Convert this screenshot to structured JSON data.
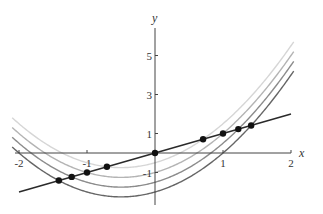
{
  "chart_data": {
    "type": "line",
    "title": "",
    "xlabel": "x",
    "ylabel": "y",
    "xlim": [
      -2,
      2
    ],
    "ylim": [
      -2.3,
      6.2
    ],
    "grid": false,
    "legend": null,
    "x_ticks": [
      -2,
      -1,
      1,
      2
    ],
    "x_tick_labels": [
      "-2",
      "-1",
      "1",
      "2"
    ],
    "y_ticks": [
      -1,
      1,
      3,
      5
    ],
    "y_tick_labels": [
      "-1",
      "1",
      "3",
      "5"
    ],
    "series": [
      {
        "name": "y = x^2 + x - 0.5",
        "formula": "x^2 + x + C",
        "C": -0.5,
        "color": "#d6d6d6"
      },
      {
        "name": "y = x^2 + x - 1",
        "formula": "x^2 + x + C",
        "C": -1,
        "color": "#b4b4b4"
      },
      {
        "name": "y = x^2 + x - 1.5",
        "formula": "x^2 + x + C",
        "C": -1.5,
        "color": "#8c8c8c"
      },
      {
        "name": "y = x^2 + x - 2",
        "formula": "x^2 + x + C",
        "C": -2,
        "color": "#666666"
      },
      {
        "name": "y = x",
        "formula": "x",
        "color": "#2a2a2a",
        "x": [
          -2,
          2
        ],
        "values": [
          -2,
          2
        ]
      }
    ],
    "points": [
      {
        "x": -1.414,
        "y": -1.414
      },
      {
        "x": -1.225,
        "y": -1.225
      },
      {
        "x": -1.0,
        "y": -1.0
      },
      {
        "x": -0.707,
        "y": -0.707
      },
      {
        "x": 0,
        "y": 0
      },
      {
        "x": 0.707,
        "y": 0.707
      },
      {
        "x": 1.0,
        "y": 1.0
      },
      {
        "x": 1.225,
        "y": 1.225
      },
      {
        "x": 1.414,
        "y": 1.414
      }
    ]
  },
  "axes": {
    "x_label": "x",
    "y_label": "y"
  }
}
